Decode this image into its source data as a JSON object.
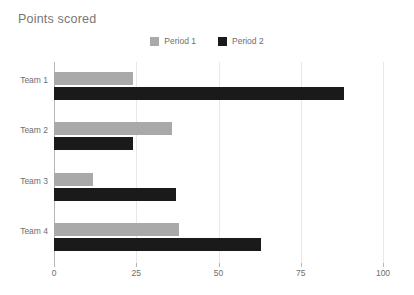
{
  "chart_data": {
    "type": "bar",
    "orientation": "horizontal",
    "title": "Points scored",
    "xlabel": "",
    "ylabel": "",
    "categories": [
      "Team 1",
      "Team 2",
      "Team 3",
      "Team 4"
    ],
    "series": [
      {
        "name": "Period 1",
        "color": "#a9a9a9",
        "values": [
          24,
          36,
          12,
          38
        ]
      },
      {
        "name": "Period 2",
        "color": "#1a1a1a",
        "values": [
          88,
          24,
          37,
          63
        ]
      }
    ],
    "xlim": [
      0,
      100
    ],
    "xticks": [
      0,
      25,
      50,
      75,
      100
    ],
    "xtick_labels": [
      "0",
      "25",
      "50",
      "75",
      "100"
    ],
    "grid": true,
    "grid_axis": "x",
    "legend_position": "top-center",
    "background_color": "#ffffff",
    "title_color": "#767676",
    "tick_label_color": "#6e6e6e",
    "gridline_color": "#e8e8e8",
    "axis_line_color": "#b5b5b5"
  }
}
